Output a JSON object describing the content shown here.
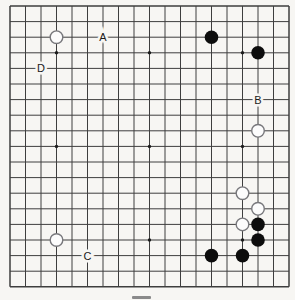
{
  "figure": {
    "type": "go-board-diagram"
  },
  "colors": {
    "background": "#f7f6f3",
    "grid": "#3e3e3e",
    "star_point": "#1c1c1c",
    "black_stone": "#0d0d0d",
    "white_stone_fill": "#fcfcfc",
    "white_stone_stroke": "#78787c",
    "label": "#1a1a1a",
    "label_halo": "#f7f6f3",
    "caption_bar": "#8a8a8a"
  },
  "board": {
    "size": 19,
    "star_points": [
      [
        4,
        4
      ],
      [
        10,
        4
      ],
      [
        16,
        4
      ],
      [
        4,
        10
      ],
      [
        10,
        10
      ],
      [
        16,
        10
      ],
      [
        4,
        16
      ],
      [
        10,
        16
      ],
      [
        16,
        16
      ]
    ],
    "stones": [
      {
        "color": "white",
        "col": 4,
        "row": 3
      },
      {
        "color": "black",
        "col": 14,
        "row": 3
      },
      {
        "color": "black",
        "col": 17,
        "row": 4
      },
      {
        "color": "white",
        "col": 17,
        "row": 9
      },
      {
        "color": "white",
        "col": 16,
        "row": 13
      },
      {
        "color": "white",
        "col": 17,
        "row": 14
      },
      {
        "color": "white",
        "col": 16,
        "row": 15
      },
      {
        "color": "black",
        "col": 17,
        "row": 15
      },
      {
        "color": "black",
        "col": 17,
        "row": 16
      },
      {
        "color": "white",
        "col": 4,
        "row": 16
      },
      {
        "color": "black",
        "col": 14,
        "row": 17
      },
      {
        "color": "black",
        "col": 16,
        "row": 17
      }
    ],
    "labels": [
      {
        "text": "A",
        "col": 7,
        "row": 3
      },
      {
        "text": "B",
        "col": 17,
        "row": 7
      },
      {
        "text": "C",
        "col": 6,
        "row": 17
      },
      {
        "text": "D",
        "col": 3,
        "row": 5
      }
    ]
  }
}
